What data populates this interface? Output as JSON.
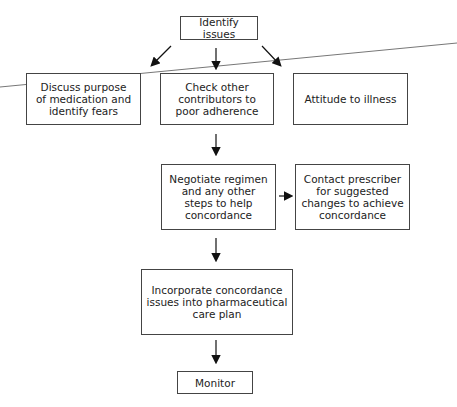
{
  "diagram": {
    "type": "flowchart",
    "nodes": {
      "identify": "Identify issues",
      "discuss": "Discuss purpose\nof medication and\nidentify fears",
      "check": "Check other\ncontributors to\npoor adherence",
      "attitude": "Attitude to illness",
      "negotiate": "Negotiate regimen\nand any other\nsteps to help\nconcordance",
      "contact": "Contact prescriber\nfor suggested\nchanges to achieve\nconcordance",
      "incorporate": "Incorporate concordance\nissues into pharmaceutical\ncare plan",
      "monitor": "Monitor"
    },
    "edges": [
      [
        "identify",
        "discuss"
      ],
      [
        "identify",
        "check"
      ],
      [
        "identify",
        "attitude"
      ],
      [
        "check",
        "negotiate"
      ],
      [
        "negotiate",
        "contact"
      ],
      [
        "negotiate",
        "incorporate"
      ],
      [
        "incorporate",
        "monitor"
      ]
    ]
  }
}
